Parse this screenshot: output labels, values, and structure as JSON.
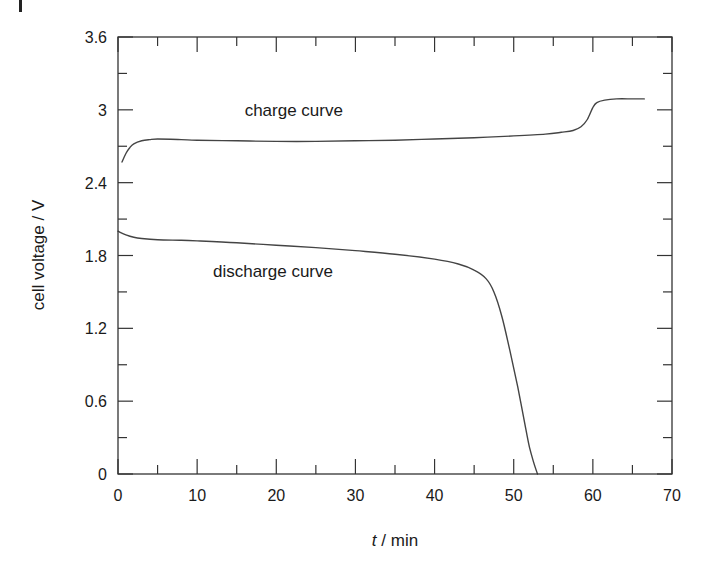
{
  "chart_data": {
    "type": "line",
    "title": "",
    "xlabel_italic": "t",
    "xlabel_rest": " / min",
    "ylabel": "cell voltage / V",
    "xlim": [
      0,
      70
    ],
    "ylim": [
      0,
      3.6
    ],
    "x_ticks": [
      0,
      10,
      20,
      30,
      40,
      50,
      60,
      70
    ],
    "x_tick_labels": [
      "0",
      "10",
      "20",
      "30",
      "40",
      "50",
      "60",
      "70"
    ],
    "x_minor_step": 5,
    "y_ticks": [
      0,
      0.6,
      1.2,
      1.8,
      2.4,
      3,
      3.6
    ],
    "y_tick_labels": [
      "0",
      "0.6",
      "1.2",
      "1.8",
      "2.4",
      "3",
      "3.6"
    ],
    "y_minor_step": 0.3,
    "grid": false,
    "legend": "none",
    "annotations": [
      {
        "text": "charge curve",
        "x": 16,
        "y": 3.0
      },
      {
        "text": "discharge curve",
        "x": 12,
        "y": 1.67
      }
    ],
    "series": [
      {
        "name": "charge curve",
        "x": [
          0.5,
          1,
          1.5,
          2,
          3,
          4,
          5,
          8,
          10,
          15,
          20,
          25,
          30,
          35,
          40,
          45,
          50,
          54,
          56,
          57.5,
          58.5,
          59.3,
          60,
          60.5,
          61.5,
          63,
          65,
          66.5
        ],
        "y": [
          2.57,
          2.64,
          2.69,
          2.72,
          2.745,
          2.755,
          2.76,
          2.755,
          2.75,
          2.745,
          2.74,
          2.74,
          2.745,
          2.75,
          2.76,
          2.77,
          2.785,
          2.8,
          2.815,
          2.83,
          2.86,
          2.92,
          3.02,
          3.06,
          3.08,
          3.09,
          3.09,
          3.09
        ]
      },
      {
        "name": "discharge curve",
        "x": [
          0,
          1,
          2,
          3,
          5,
          8,
          10,
          15,
          20,
          25,
          30,
          35,
          40,
          43,
          45,
          46.5,
          47.5,
          48.5,
          49.5,
          50.5,
          51.5,
          52,
          52.5,
          53
        ],
        "y": [
          2.0,
          1.97,
          1.95,
          1.94,
          1.93,
          1.925,
          1.92,
          1.905,
          1.885,
          1.865,
          1.84,
          1.81,
          1.77,
          1.73,
          1.68,
          1.61,
          1.5,
          1.3,
          1.02,
          0.72,
          0.38,
          0.22,
          0.1,
          0.0
        ]
      }
    ]
  }
}
